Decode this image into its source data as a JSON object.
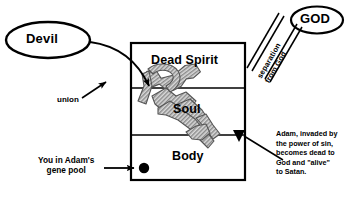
{
  "diagram": {
    "title_devil": "Devil",
    "title_god": "GOD",
    "separation_label": "separation\nfrom God",
    "union_label": "union",
    "tiers": [
      {
        "id": "dead-spirit",
        "label": "Dead Spirit"
      },
      {
        "id": "soul",
        "label": "Soul"
      },
      {
        "id": "body",
        "label": "Body"
      }
    ],
    "gene_pool_label": "You  in Adam's\ngene  pool",
    "adam_note": "Adam, invaded by\nthe power of sin,\nbecomes dead to\nGod and \"alive\"\nto Satan.",
    "colors": {
      "ink": "#000000",
      "background": "#ffffff",
      "zigzag_fill": "#a8a8a8",
      "zigzag_stroke": "#333333"
    }
  }
}
